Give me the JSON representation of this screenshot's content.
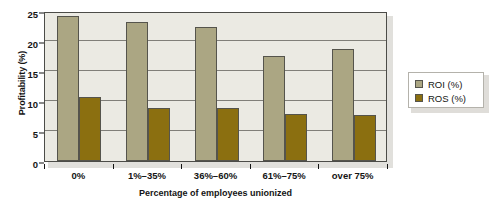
{
  "chart_data": {
    "type": "bar",
    "title": "",
    "xlabel": "Percentage of employees unionized",
    "ylabel": "Profitability (%)",
    "categories": [
      "0%",
      "1%–35%",
      "36%–60%",
      "61%–75%",
      "over 75%"
    ],
    "series": [
      {
        "name": "ROI (%)",
        "color": "#aba683",
        "values": [
          24.2,
          23.2,
          22.3,
          17.5,
          18.7
        ]
      },
      {
        "name": "ROS (%)",
        "color": "#8b6f10",
        "values": [
          10.7,
          8.8,
          8.9,
          7.9,
          7.6
        ]
      }
    ],
    "ylim": [
      0,
      25
    ],
    "yticks": [
      0,
      5,
      10,
      15,
      20,
      25
    ],
    "ytick_labels": [
      "0",
      "5",
      "10",
      "15",
      "20",
      "25"
    ],
    "grid": true,
    "legend_position": "right",
    "legend_entries": [
      "ROI (%)",
      "ROS (%)"
    ]
  }
}
